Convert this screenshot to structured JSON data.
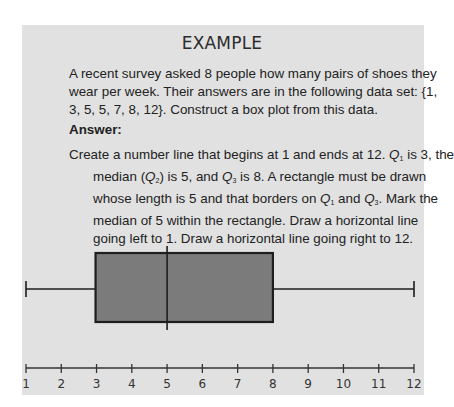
{
  "example": {
    "title": "EXAMPLE",
    "question_lines": [
      "A recent survey asked 8 people how many pairs of shoes they",
      "wear per week. Their answers are in the following data set: {1,",
      "3, 5, 5, 7, 8, 12}. Construct a box plot from this data."
    ],
    "answer_label": "Answer:",
    "answer_lines": {
      "l1a": "Create a number line that begins at 1 and ends at 12. ",
      "l1q": "Q",
      "l1s": "1",
      "l1b": " is 3, the",
      "l2a": "median (",
      "l2q": "Q",
      "l2s": "2",
      "l2b": ") is 5, and ",
      "l2q2": "Q",
      "l2s2": "3",
      "l2c": " is 8. A rectangle must be drawn",
      "l3a": "whose length is 5 and that borders on ",
      "l3q": "Q",
      "l3s": "1",
      "l3b": " and ",
      "l3q2": "Q",
      "l3s2": "3",
      "l3c": ". Mark the",
      "l4": "median of 5 within the rectangle. Draw a horizontal line",
      "l5": "going left to 1. Draw a horizontal line going right to 12."
    }
  },
  "chart_data": {
    "type": "boxplot",
    "data_set": [
      1,
      3,
      5,
      5,
      7,
      8,
      12
    ],
    "min": 1,
    "q1": 3,
    "median": 5,
    "q3": 8,
    "max": 12,
    "axis": {
      "range": [
        1,
        12
      ],
      "ticks": [
        "1",
        "2",
        "3",
        "4",
        "5",
        "6",
        "7",
        "8",
        "9",
        "10",
        "11",
        "12"
      ]
    },
    "colors": {
      "box_fill": "#7b7b7b",
      "stroke": "#1e1e1e",
      "panel": "#e1e1e1"
    }
  }
}
